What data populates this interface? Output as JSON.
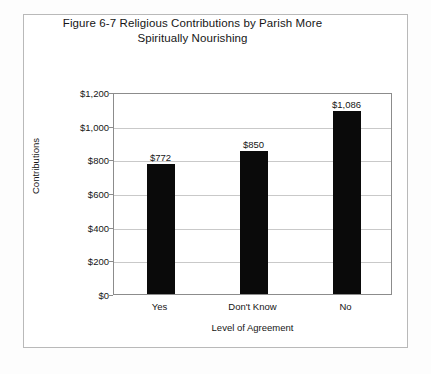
{
  "figure": {
    "title_line1": "Figure 6-7 Religious Contributions by Parish More",
    "title_line2": "Spiritually Nourishing"
  },
  "chart_data": {
    "type": "bar",
    "title": "Figure 6-7 Religious Contributions by Parish More Spiritually Nourishing",
    "categories": [
      "Yes",
      "Don't Know",
      "No"
    ],
    "values": [
      772,
      850,
      1086
    ],
    "data_labels": [
      "$772",
      "$850",
      "$1,086"
    ],
    "xlabel": "Level of Agreement",
    "ylabel": "Contributions",
    "ylim": [
      0,
      1200
    ],
    "ytick_values": [
      0,
      200,
      400,
      600,
      800,
      1000,
      1200
    ],
    "ytick_labels": [
      "$0",
      "$200",
      "$400",
      "$600",
      "$800",
      "$1,000",
      "$1,200"
    ],
    "grid": true,
    "legend": false,
    "bar_color": "#0a0a0a",
    "gridline_color": "#c9c9c9",
    "axis_color": "#8c8c8c"
  }
}
